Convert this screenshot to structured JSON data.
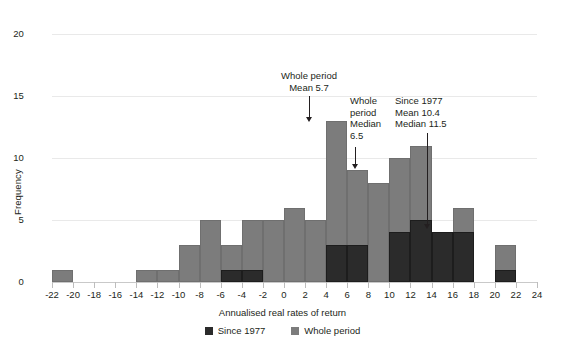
{
  "chart_data": {
    "type": "bar",
    "title": "",
    "xlabel": "Annualised real rates of return",
    "ylabel": "Frequency",
    "xlim": [
      -22,
      24
    ],
    "ylim": [
      0,
      20
    ],
    "grid": true,
    "bin_width": 2,
    "xticks": [
      "-22",
      "-20",
      "-18",
      "-16",
      "-14",
      "-12",
      "-10",
      "-8",
      "-6",
      "-4",
      "-2",
      "0",
      "2",
      "4",
      "6",
      "8",
      "10",
      "12",
      "14",
      "16",
      "18",
      "20",
      "22",
      "24"
    ],
    "xtick_values": [
      -22,
      -20,
      -18,
      -16,
      -14,
      -12,
      -10,
      -8,
      -6,
      -4,
      -2,
      0,
      2,
      4,
      6,
      8,
      10,
      12,
      14,
      16,
      18,
      20,
      22,
      24
    ],
    "yticks": [
      "0",
      "5",
      "10",
      "15",
      "20"
    ],
    "ytick_values": [
      0,
      5,
      10,
      15,
      20
    ],
    "legend_position": "bottom",
    "bins": [
      {
        "start": -22,
        "end": -20,
        "whole_period": 1,
        "since_1977": 0
      },
      {
        "start": -20,
        "end": -18,
        "whole_period": 0,
        "since_1977": 0
      },
      {
        "start": -18,
        "end": -16,
        "whole_period": 0,
        "since_1977": 0
      },
      {
        "start": -16,
        "end": -14,
        "whole_period": 0,
        "since_1977": 0
      },
      {
        "start": -14,
        "end": -12,
        "whole_period": 1,
        "since_1977": 0
      },
      {
        "start": -12,
        "end": -10,
        "whole_period": 1,
        "since_1977": 0
      },
      {
        "start": -10,
        "end": -8,
        "whole_period": 3,
        "since_1977": 0
      },
      {
        "start": -8,
        "end": -6,
        "whole_period": 5,
        "since_1977": 0
      },
      {
        "start": -6,
        "end": -4,
        "whole_period": 3,
        "since_1977": 1
      },
      {
        "start": -4,
        "end": -2,
        "whole_period": 5,
        "since_1977": 1
      },
      {
        "start": -2,
        "end": 0,
        "whole_period": 5,
        "since_1977": 0
      },
      {
        "start": 0,
        "end": 2,
        "whole_period": 6,
        "since_1977": 0
      },
      {
        "start": 2,
        "end": 4,
        "whole_period": 5,
        "since_1977": 0
      },
      {
        "start": 4,
        "end": 6,
        "whole_period": 13,
        "since_1977": 3
      },
      {
        "start": 6,
        "end": 8,
        "whole_period": 9,
        "since_1977": 3
      },
      {
        "start": 8,
        "end": 10,
        "whole_period": 8,
        "since_1977": 0
      },
      {
        "start": 10,
        "end": 12,
        "whole_period": 10,
        "since_1977": 4
      },
      {
        "start": 12,
        "end": 14,
        "whole_period": 11,
        "since_1977": 5
      },
      {
        "start": 14,
        "end": 16,
        "whole_period": 4,
        "since_1977": 4
      },
      {
        "start": 16,
        "end": 18,
        "whole_period": 6,
        "since_1977": 4
      },
      {
        "start": 18,
        "end": 20,
        "whole_period": 0,
        "since_1977": 0
      },
      {
        "start": 20,
        "end": 22,
        "whole_period": 3,
        "since_1977": 1
      },
      {
        "start": 22,
        "end": 24,
        "whole_period": 0,
        "since_1977": 0
      }
    ],
    "series": [
      {
        "name": "Since 1977",
        "color": "#2b2b2b",
        "values": [
          0,
          0,
          0,
          0,
          0,
          0,
          0,
          0,
          1,
          1,
          0,
          0,
          0,
          3,
          3,
          0,
          4,
          5,
          4,
          4,
          0,
          1,
          0
        ]
      },
      {
        "name": "Whole period",
        "color": "#7c7c7c",
        "values": [
          1,
          0,
          0,
          0,
          1,
          1,
          3,
          5,
          3,
          5,
          5,
          6,
          5,
          13,
          9,
          8,
          10,
          11,
          4,
          6,
          0,
          3,
          0
        ]
      }
    ],
    "annotations": [
      {
        "id": "whole-mean",
        "text": "Whole period\nMean 5.7",
        "x_value": 5.7,
        "points_to_y": 13
      },
      {
        "id": "whole-median",
        "text": "Whole\nperiod\nMedian\n6.5",
        "x_value": 6.5,
        "points_to_y": 9
      },
      {
        "id": "since-1977-stats",
        "text": "Since 1977\nMean 10.4\nMedian 11.5",
        "x_value": 11.5,
        "points_to_y": 4
      }
    ]
  },
  "legend": {
    "items": [
      {
        "label": "Since 1977",
        "color": "#2b2b2b"
      },
      {
        "label": "Whole period",
        "color": "#7c7c7c"
      }
    ]
  }
}
